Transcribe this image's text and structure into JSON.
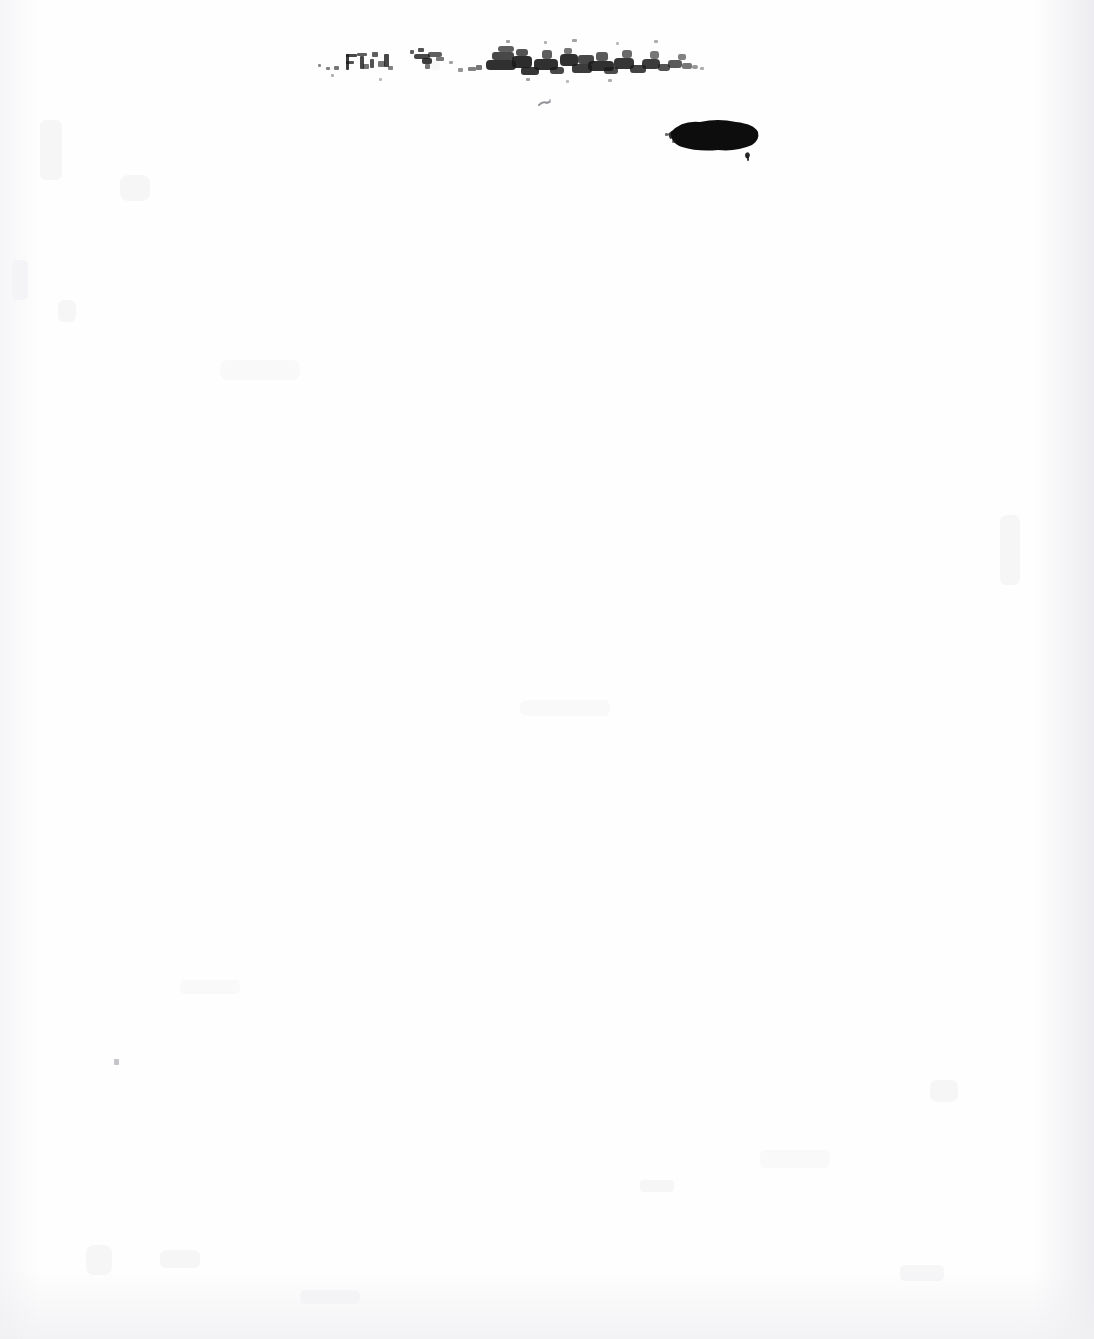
{
  "document": {
    "kind": "scanned-archival-page",
    "page_background_color": "#fefefe",
    "width_px": 1094,
    "height_px": 1339,
    "visible_text": "",
    "legibility_note": "No legible text is rendered on this page; all ink marks are degraded, smeared or obliterated."
  },
  "marks": {
    "smudged_text_line": {
      "label": "illegible-smeared-ink-line",
      "transcription": "",
      "ink_color": "#1a1a1a",
      "bounds": {
        "x": 320,
        "y": 38,
        "width": 382,
        "height": 44
      }
    },
    "ink_blot": {
      "label": "solid-black-ink-blot",
      "ink_color": "#0d0d0d",
      "bounds": {
        "x": 668,
        "y": 122,
        "width": 90,
        "height": 28
      }
    },
    "faint_mark": {
      "label": "small-faint-ink-mark",
      "ink_color": "#6e6e76",
      "bounds": {
        "x": 540,
        "y": 100,
        "width": 12,
        "height": 8
      }
    },
    "speck": {
      "label": "dust-speck",
      "ink_color": "#96969e",
      "bounds": {
        "x": 114,
        "y": 1059,
        "width": 5,
        "height": 6
      }
    }
  },
  "attached_slip": {
    "label": "blank-attached-slip",
    "shape": "rounded-rectangle",
    "content": "",
    "rotation_deg": -5.5,
    "outline_color": "#ececef",
    "corners": {
      "top_left": {
        "x": 692,
        "y": 348
      },
      "top_right": {
        "x": 1058,
        "y": 315
      },
      "bottom_right": {
        "x": 1085,
        "y": 897
      },
      "bottom_left": {
        "x": 758,
        "y": 930
      }
    },
    "clipped_at_right_margin": true
  },
  "scan_artifacts": {
    "right_edge_gradient": true,
    "bottom_edge_gradient": true,
    "left_edge_gradient": true,
    "speckle_noise": true
  }
}
